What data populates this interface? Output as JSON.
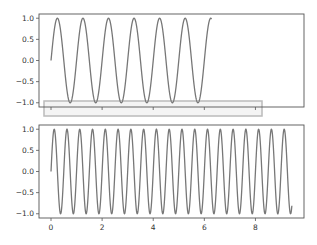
{
  "chart_data": [
    {
      "type": "line",
      "title": "",
      "xlabel": "",
      "ylabel": "",
      "function": "y = sin(2*pi*x)",
      "x_range": [
        0,
        6.283
      ],
      "xlim": [
        -0.47,
        9.9
      ],
      "ylim": [
        -1.1,
        1.1
      ],
      "yticks": [
        1.0,
        0.5,
        0.0,
        -0.5,
        -1.0
      ],
      "ytick_labels": [
        "1.0",
        "0.5",
        "0.0",
        "−0.5",
        "−1.0"
      ],
      "xticks": [
        0,
        2,
        4,
        6,
        8
      ],
      "xtick_labels_visible": false,
      "series": [
        {
          "name": "sin(2πx)",
          "color": "#777777"
        }
      ],
      "grid": false,
      "highlight_box": {
        "description": "gray rectangle around x-axis tick area",
        "color": "#bbbbbb"
      }
    },
    {
      "type": "line",
      "title": "",
      "xlabel": "",
      "ylabel": "",
      "function": "y = sin(4*pi*x)",
      "x_range": [
        0,
        9.425
      ],
      "xlim": [
        -0.47,
        9.9
      ],
      "ylim": [
        -1.1,
        1.1
      ],
      "yticks": [
        1.0,
        0.5,
        0.0,
        -0.5,
        -1.0
      ],
      "ytick_labels": [
        "1.0",
        "0.5",
        "0.0",
        "−0.5",
        "−1.0"
      ],
      "xticks": [
        0,
        2,
        4,
        6,
        8
      ],
      "xtick_labels": [
        "0",
        "2",
        "4",
        "6",
        "8"
      ],
      "series": [
        {
          "name": "sin(4πx)",
          "color": "#777777"
        }
      ],
      "grid": false
    }
  ]
}
